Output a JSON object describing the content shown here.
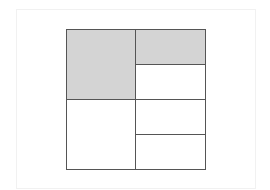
{
  "diagram": {
    "type": "area-model-grid",
    "grid": {
      "x": 66,
      "y": 29,
      "width": 140,
      "height": 141
    },
    "colors": {
      "shaded": "#d4d4d4",
      "unshaded": "#ffffff",
      "line": "#555555"
    },
    "cells": [
      {
        "name": "top-left",
        "shaded": true,
        "x": 0,
        "y": 0,
        "w": 70,
        "h": 71
      },
      {
        "name": "bottom-left",
        "shaded": false,
        "x": 0,
        "y": 70,
        "w": 70,
        "h": 71
      },
      {
        "name": "right-row-1",
        "shaded": true,
        "x": 69,
        "y": 0,
        "w": 71,
        "h": 36
      },
      {
        "name": "right-row-2",
        "shaded": false,
        "x": 69,
        "y": 35,
        "w": 71,
        "h": 36
      },
      {
        "name": "right-row-3",
        "shaded": false,
        "x": 69,
        "y": 70,
        "w": 71,
        "h": 36
      },
      {
        "name": "right-row-4",
        "shaded": false,
        "x": 69,
        "y": 105,
        "w": 71,
        "h": 36
      }
    ],
    "summary": {
      "shaded_cells": 2,
      "total_cells": 6,
      "shaded_fraction_of_whole": "3/8"
    }
  }
}
